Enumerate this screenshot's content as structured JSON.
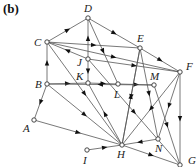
{
  "panel_label": "(b)",
  "diagram": {
    "type": "directed-graph",
    "nodes": [
      {
        "id": "D",
        "x": 88,
        "y": 18,
        "lx": 84,
        "ly": 12
      },
      {
        "id": "C",
        "x": 47,
        "y": 42,
        "lx": 34,
        "ly": 46
      },
      {
        "id": "E",
        "x": 140,
        "y": 48,
        "lx": 137,
        "ly": 42
      },
      {
        "id": "F",
        "x": 180,
        "y": 72,
        "lx": 186,
        "ly": 70
      },
      {
        "id": "J",
        "x": 88,
        "y": 59,
        "lx": 77,
        "ly": 66
      },
      {
        "id": "K",
        "x": 88,
        "y": 83,
        "lx": 76,
        "ly": 80
      },
      {
        "id": "B",
        "x": 47,
        "y": 84,
        "lx": 35,
        "ly": 88
      },
      {
        "id": "L",
        "x": 118,
        "y": 84,
        "lx": 114,
        "ly": 98
      },
      {
        "id": "M",
        "x": 154,
        "y": 85,
        "lx": 150,
        "ly": 80
      },
      {
        "id": "A",
        "x": 34,
        "y": 120,
        "lx": 23,
        "ly": 132
      },
      {
        "id": "I",
        "x": 87,
        "y": 150,
        "lx": 83,
        "ly": 164
      },
      {
        "id": "H",
        "x": 122,
        "y": 145,
        "lx": 117,
        "ly": 158
      },
      {
        "id": "N",
        "x": 158,
        "y": 139,
        "lx": 155,
        "ly": 152
      },
      {
        "id": "G",
        "x": 180,
        "y": 165,
        "lx": 188,
        "ly": 164
      }
    ],
    "edges": [
      {
        "from": "C",
        "to": "D"
      },
      {
        "from": "D",
        "to": "E"
      },
      {
        "from": "C",
        "to": "E"
      },
      {
        "from": "E",
        "to": "F"
      },
      {
        "from": "J",
        "to": "D"
      },
      {
        "from": "J",
        "to": "C"
      },
      {
        "from": "C",
        "to": "F"
      },
      {
        "from": "J",
        "to": "F"
      },
      {
        "from": "B",
        "to": "C"
      },
      {
        "from": "C",
        "to": "H"
      },
      {
        "from": "J",
        "to": "K"
      },
      {
        "from": "B",
        "to": "K"
      },
      {
        "from": "K",
        "to": "L"
      },
      {
        "from": "L",
        "to": "M"
      },
      {
        "from": "M",
        "to": "B"
      },
      {
        "from": "B",
        "to": "A"
      },
      {
        "from": "B",
        "to": "H"
      },
      {
        "from": "A",
        "to": "H"
      },
      {
        "from": "H",
        "to": "K"
      },
      {
        "from": "I",
        "to": "H"
      },
      {
        "from": "H",
        "to": "G"
      },
      {
        "from": "N",
        "to": "H"
      },
      {
        "from": "E",
        "to": "H"
      },
      {
        "from": "D",
        "to": "L"
      },
      {
        "from": "E",
        "to": "N"
      },
      {
        "from": "F",
        "to": "H"
      },
      {
        "from": "F",
        "to": "N"
      },
      {
        "from": "F",
        "to": "G"
      },
      {
        "from": "M",
        "to": "G"
      },
      {
        "from": "J",
        "to": "G"
      },
      {
        "from": "H",
        "to": "E"
      }
    ]
  }
}
